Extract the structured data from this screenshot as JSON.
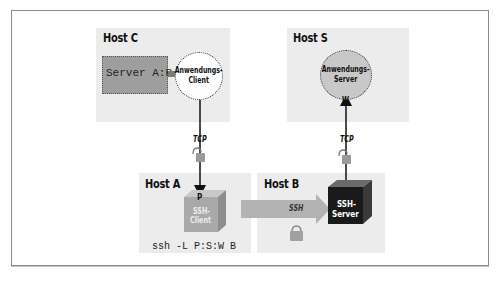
{
  "diagram": {
    "hosts": {
      "host_c": {
        "label": "Host C",
        "server_box": "Server A:P",
        "client": "Anwendungs-\nClient",
        "client_line1": "Anwendungs-",
        "client_line2": "Client"
      },
      "host_s": {
        "label": "Host S",
        "server_line1": "Anwendungs-",
        "server_line2": "Server",
        "port": "W"
      },
      "host_a": {
        "label": "Host A",
        "port": "P",
        "ssh_client_line1": "SSH-",
        "ssh_client_line2": "Client",
        "command": "ssh -L P:S:W B"
      },
      "host_b": {
        "label": "Host B",
        "ssh_server_line1": "SSH-",
        "ssh_server_line2": "Server"
      }
    },
    "connections": {
      "left_tcp": "TCP",
      "right_tcp": "TCP",
      "tunnel": "SSH"
    },
    "colors": {
      "host_bg": "#ececec",
      "server_box": "#9e9e9e",
      "server_circle": "#c8c8c8",
      "ssh_client_cube": "#a9a9a9",
      "ssh_server_cube": "#1a1a1a",
      "tunnel_arrow": "#b3b3b3",
      "frame_border": "#8a8a8a"
    }
  }
}
